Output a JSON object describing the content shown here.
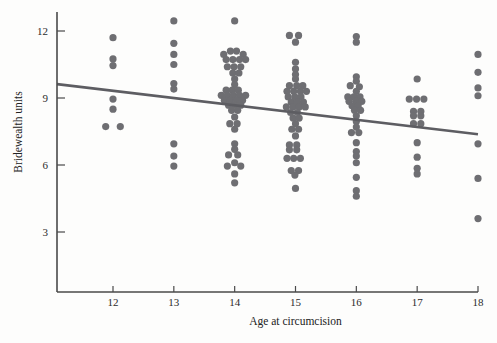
{
  "chart_data": {
    "type": "scatter",
    "title": "",
    "xlabel": "Age at circumcision",
    "ylabel": "Bridewealth units",
    "xlim": [
      11.1,
      18.0
    ],
    "ylim": [
      1.6,
      13.2
    ],
    "xticks": [
      12,
      13,
      14,
      15,
      16,
      17,
      18
    ],
    "xtick_labels": [
      "12",
      "13",
      "14",
      "15",
      "16",
      "17",
      "18"
    ],
    "yticks": [
      3,
      6,
      9,
      12
    ],
    "ytick_labels": [
      "3",
      "6",
      "9",
      "12"
    ],
    "grid": false,
    "legend": false,
    "point_color": "#6e6e72",
    "line_color": "#5d5d62",
    "background_color": "#fdfdfc",
    "axis_color": "#4a4a4a",
    "marker_radius_px": 3.6,
    "trendline": {
      "label": "linear fit",
      "x_start": 11.08,
      "y_start": 9.62,
      "x_end": 18.0,
      "y_end": 7.38
    },
    "points": [
      {
        "x": 12.0,
        "y": 11.7
      },
      {
        "x": 12.0,
        "y": 10.75
      },
      {
        "x": 12.0,
        "y": 10.45
      },
      {
        "x": 12.0,
        "y": 8.95
      },
      {
        "x": 12.0,
        "y": 8.5
      },
      {
        "x": 11.88,
        "y": 7.72
      },
      {
        "x": 12.12,
        "y": 7.72
      },
      {
        "x": 13.0,
        "y": 12.45
      },
      {
        "x": 13.0,
        "y": 11.45
      },
      {
        "x": 13.0,
        "y": 10.95
      },
      {
        "x": 13.0,
        "y": 10.5
      },
      {
        "x": 13.0,
        "y": 9.65
      },
      {
        "x": 13.0,
        "y": 9.4
      },
      {
        "x": 13.0,
        "y": 6.95
      },
      {
        "x": 13.0,
        "y": 6.4
      },
      {
        "x": 13.0,
        "y": 5.95
      },
      {
        "x": 14.0,
        "y": 12.45
      },
      {
        "x": 13.82,
        "y": 10.95
      },
      {
        "x": 13.93,
        "y": 11.1
      },
      {
        "x": 14.03,
        "y": 11.1
      },
      {
        "x": 14.14,
        "y": 10.95
      },
      {
        "x": 13.86,
        "y": 10.72
      },
      {
        "x": 13.97,
        "y": 10.72
      },
      {
        "x": 14.08,
        "y": 10.72
      },
      {
        "x": 14.18,
        "y": 10.72
      },
      {
        "x": 13.88,
        "y": 10.4
      },
      {
        "x": 13.99,
        "y": 10.4
      },
      {
        "x": 14.1,
        "y": 10.4
      },
      {
        "x": 13.97,
        "y": 10.12
      },
      {
        "x": 14.07,
        "y": 10.12
      },
      {
        "x": 14.0,
        "y": 9.85
      },
      {
        "x": 14.0,
        "y": 9.6
      },
      {
        "x": 13.86,
        "y": 9.35
      },
      {
        "x": 13.96,
        "y": 9.35
      },
      {
        "x": 14.06,
        "y": 9.35
      },
      {
        "x": 13.78,
        "y": 9.12
      },
      {
        "x": 13.88,
        "y": 9.12
      },
      {
        "x": 13.98,
        "y": 9.12
      },
      {
        "x": 14.08,
        "y": 9.12
      },
      {
        "x": 14.18,
        "y": 9.12
      },
      {
        "x": 13.83,
        "y": 8.9
      },
      {
        "x": 13.93,
        "y": 8.9
      },
      {
        "x": 14.03,
        "y": 8.9
      },
      {
        "x": 14.13,
        "y": 8.9
      },
      {
        "x": 13.9,
        "y": 8.68
      },
      {
        "x": 14.0,
        "y": 8.68
      },
      {
        "x": 14.1,
        "y": 8.68
      },
      {
        "x": 13.95,
        "y": 8.45
      },
      {
        "x": 14.05,
        "y": 8.45
      },
      {
        "x": 14.0,
        "y": 8.15
      },
      {
        "x": 13.92,
        "y": 7.85
      },
      {
        "x": 14.04,
        "y": 7.85
      },
      {
        "x": 14.0,
        "y": 7.6
      },
      {
        "x": 14.0,
        "y": 6.95
      },
      {
        "x": 14.0,
        "y": 6.7
      },
      {
        "x": 13.9,
        "y": 6.45
      },
      {
        "x": 14.05,
        "y": 6.45
      },
      {
        "x": 13.88,
        "y": 5.95
      },
      {
        "x": 14.0,
        "y": 6.1
      },
      {
        "x": 14.1,
        "y": 5.95
      },
      {
        "x": 14.0,
        "y": 5.6
      },
      {
        "x": 14.0,
        "y": 5.2
      },
      {
        "x": 14.9,
        "y": 11.8
      },
      {
        "x": 15.05,
        "y": 11.8
      },
      {
        "x": 15.0,
        "y": 11.5
      },
      {
        "x": 15.0,
        "y": 10.6
      },
      {
        "x": 15.0,
        "y": 10.3
      },
      {
        "x": 15.0,
        "y": 10.05
      },
      {
        "x": 15.0,
        "y": 9.85
      },
      {
        "x": 14.9,
        "y": 9.55
      },
      {
        "x": 15.02,
        "y": 9.55
      },
      {
        "x": 15.12,
        "y": 9.55
      },
      {
        "x": 14.86,
        "y": 9.3
      },
      {
        "x": 14.97,
        "y": 9.3
      },
      {
        "x": 15.08,
        "y": 9.3
      },
      {
        "x": 15.18,
        "y": 9.3
      },
      {
        "x": 14.88,
        "y": 9.05
      },
      {
        "x": 14.99,
        "y": 9.05
      },
      {
        "x": 15.09,
        "y": 9.05
      },
      {
        "x": 14.93,
        "y": 8.82
      },
      {
        "x": 15.03,
        "y": 8.82
      },
      {
        "x": 15.13,
        "y": 8.82
      },
      {
        "x": 14.85,
        "y": 8.6
      },
      {
        "x": 14.96,
        "y": 8.6
      },
      {
        "x": 15.06,
        "y": 8.6
      },
      {
        "x": 15.16,
        "y": 8.6
      },
      {
        "x": 14.92,
        "y": 8.35
      },
      {
        "x": 15.03,
        "y": 8.35
      },
      {
        "x": 14.96,
        "y": 8.1
      },
      {
        "x": 15.06,
        "y": 8.1
      },
      {
        "x": 15.0,
        "y": 7.85
      },
      {
        "x": 14.94,
        "y": 7.6
      },
      {
        "x": 15.05,
        "y": 7.6
      },
      {
        "x": 15.0,
        "y": 7.3
      },
      {
        "x": 14.9,
        "y": 6.9
      },
      {
        "x": 15.02,
        "y": 6.9
      },
      {
        "x": 14.9,
        "y": 6.68
      },
      {
        "x": 15.02,
        "y": 6.68
      },
      {
        "x": 14.86,
        "y": 6.3
      },
      {
        "x": 14.97,
        "y": 6.3
      },
      {
        "x": 15.08,
        "y": 6.3
      },
      {
        "x": 14.93,
        "y": 5.75
      },
      {
        "x": 15.05,
        "y": 5.75
      },
      {
        "x": 14.99,
        "y": 5.55
      },
      {
        "x": 15.0,
        "y": 4.95
      },
      {
        "x": 16.0,
        "y": 11.75
      },
      {
        "x": 16.0,
        "y": 11.5
      },
      {
        "x": 16.0,
        "y": 9.95
      },
      {
        "x": 16.0,
        "y": 9.75
      },
      {
        "x": 15.9,
        "y": 9.55
      },
      {
        "x": 16.05,
        "y": 9.5
      },
      {
        "x": 16.0,
        "y": 9.3
      },
      {
        "x": 15.86,
        "y": 9.05
      },
      {
        "x": 15.96,
        "y": 9.05
      },
      {
        "x": 16.06,
        "y": 9.05
      },
      {
        "x": 15.88,
        "y": 8.85
      },
      {
        "x": 15.99,
        "y": 8.85
      },
      {
        "x": 16.09,
        "y": 8.85
      },
      {
        "x": 15.93,
        "y": 8.65
      },
      {
        "x": 16.03,
        "y": 8.65
      },
      {
        "x": 15.97,
        "y": 8.45
      },
      {
        "x": 16.07,
        "y": 8.45
      },
      {
        "x": 16.0,
        "y": 8.2
      },
      {
        "x": 16.0,
        "y": 7.95
      },
      {
        "x": 16.0,
        "y": 7.7
      },
      {
        "x": 15.92,
        "y": 7.45
      },
      {
        "x": 16.04,
        "y": 7.45
      },
      {
        "x": 16.0,
        "y": 7.0
      },
      {
        "x": 16.0,
        "y": 6.6
      },
      {
        "x": 16.0,
        "y": 6.4
      },
      {
        "x": 16.0,
        "y": 6.1
      },
      {
        "x": 16.0,
        "y": 5.45
      },
      {
        "x": 16.0,
        "y": 4.85
      },
      {
        "x": 16.0,
        "y": 4.6
      },
      {
        "x": 17.0,
        "y": 9.85
      },
      {
        "x": 16.87,
        "y": 8.95
      },
      {
        "x": 16.99,
        "y": 8.95
      },
      {
        "x": 17.11,
        "y": 8.95
      },
      {
        "x": 16.94,
        "y": 8.4
      },
      {
        "x": 17.06,
        "y": 8.4
      },
      {
        "x": 16.94,
        "y": 8.2
      },
      {
        "x": 17.06,
        "y": 8.2
      },
      {
        "x": 16.94,
        "y": 7.85
      },
      {
        "x": 17.06,
        "y": 7.85
      },
      {
        "x": 17.0,
        "y": 7.0
      },
      {
        "x": 17.0,
        "y": 6.35
      },
      {
        "x": 17.0,
        "y": 5.85
      },
      {
        "x": 17.0,
        "y": 5.6
      },
      {
        "x": 18.0,
        "y": 10.95
      },
      {
        "x": 18.0,
        "y": 10.15
      },
      {
        "x": 18.0,
        "y": 9.45
      },
      {
        "x": 18.0,
        "y": 9.1
      },
      {
        "x": 18.0,
        "y": 6.95
      },
      {
        "x": 18.0,
        "y": 5.4
      },
      {
        "x": 18.0,
        "y": 3.6
      }
    ]
  }
}
